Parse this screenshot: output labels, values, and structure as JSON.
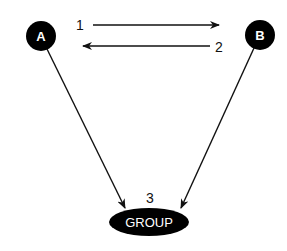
{
  "diagram": {
    "nodes": [
      {
        "id": "A",
        "label": "A",
        "shape": "circle"
      },
      {
        "id": "B",
        "label": "B",
        "shape": "circle"
      },
      {
        "id": "GROUP",
        "label": "GROUP",
        "shape": "ellipse"
      }
    ],
    "edges": [
      {
        "from": "A",
        "to": "B",
        "label": "1"
      },
      {
        "from": "B",
        "to": "A",
        "label": "2"
      },
      {
        "from": "A",
        "to": "GROUP",
        "label": ""
      },
      {
        "from": "B",
        "to": "GROUP",
        "label": ""
      }
    ],
    "group_label_number": "3",
    "colors": {
      "node_fill": "#000000",
      "node_text": "#ffffff",
      "line": "#111111",
      "background": "#ffffff"
    }
  }
}
